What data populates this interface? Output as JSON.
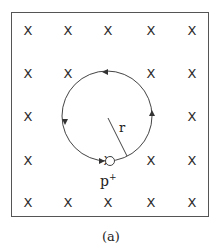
{
  "figure": {
    "caption": "(a)",
    "field_symbol": "X",
    "field_grid": {
      "columns_x": [
        28,
        68,
        108,
        151,
        192
      ],
      "rows_y": [
        30,
        73,
        116,
        160,
        202
      ],
      "omitted": [
        [
          2,
          1
        ],
        [
          2,
          2
        ],
        [
          3,
          2
        ],
        [
          1,
          2
        ],
        [
          1,
          3
        ]
      ]
    },
    "orbit": {
      "cx": 107,
      "cy": 116,
      "r": 45,
      "direction": "counterclockwise"
    },
    "particle": {
      "label": "p",
      "charge_sup": "+",
      "cx": 110,
      "cy": 161,
      "r": 4
    },
    "radius_label": "r",
    "colors": {
      "stroke": "#444444",
      "frame": "#555555",
      "text": "#222222"
    }
  }
}
